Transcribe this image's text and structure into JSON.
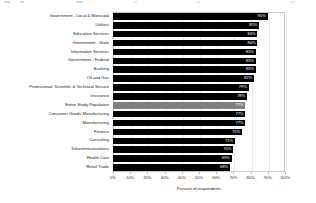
{
  "chart_data": {
    "type": "bar",
    "orientation": "horizontal",
    "title": "",
    "xlabel": "Percent of respondents",
    "ylabel": "",
    "xlim": [
      0,
      100
    ],
    "grid": true,
    "legend": null,
    "tick_labels": [
      "0%",
      "10%",
      "20%",
      "30%",
      "40%",
      "50%",
      "60%",
      "70%",
      "80%",
      "90%",
      "100%"
    ],
    "tick_values": [
      0,
      10,
      20,
      30,
      40,
      50,
      60,
      70,
      80,
      90,
      100
    ],
    "categories": [
      "Government - Local & Municipal",
      "Utilities",
      "Education Services",
      "Government - State",
      "Information Services",
      "Government - Federal",
      "Banking",
      "Oil and Gas",
      "Professional, Scientific & Technical Service",
      "Insurance",
      "Entire Study Population",
      "Consumer Goods Manufacturing",
      "Manufacturing",
      "Finance",
      "Consulting",
      "Telecommunications",
      "Health Care",
      "Retail Trade"
    ],
    "values": [
      90,
      85,
      84,
      84,
      83,
      83,
      83,
      82,
      79,
      78,
      77,
      77,
      77,
      75,
      71,
      70,
      69,
      68
    ],
    "value_labels": [
      "90%",
      "85%",
      "84%",
      "84%",
      "83%",
      "83%",
      "83%",
      "82%",
      "79%",
      "78%",
      "77%",
      "77%",
      "77%",
      "75%",
      "71%",
      "70%",
      "69%",
      "68%"
    ],
    "highlight_category": "Entire Study Population",
    "colors": {
      "bar": "#000000",
      "highlight_bar": "#808080",
      "value_text": "#ffffff",
      "plot_border": "#c9c9cf",
      "gridline": "#ececed",
      "background": "#ffffff"
    }
  }
}
